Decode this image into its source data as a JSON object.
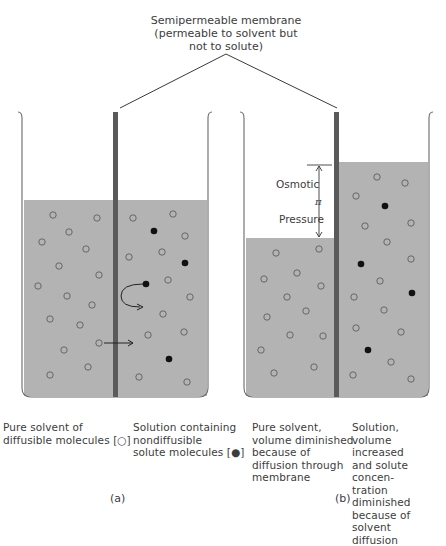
{
  "title": {
    "text": "Semipermeable membrane\n(permeable to solvent but\nnot to solute)"
  },
  "panels": [
    {
      "id": "a",
      "label": "(a)",
      "left_caption": "Pure solvent of\ndiffusible molecules [○]",
      "right_caption": "Solution containing\nnondiffusible\nsolute molecules [●]"
    },
    {
      "id": "b",
      "label": "(b)",
      "left_caption": "Pure solvent,\nvolume diminished\nbecause of\ndiffusion through\nmembrane",
      "right_caption": "Solution,\nvolume increased\nand solute concen-\ntration diminished\nbecause of solvent\ndiffusion",
      "annotation_top": "Osmotic",
      "annotation_symbol": "π",
      "annotation_bottom": "Pressure"
    }
  ],
  "colors": {
    "liquid": "#b3b3b3",
    "membrane": "#5a5a5a",
    "beaker_outline": "#6a6a6a",
    "molecule_outline": "#5e5e5e",
    "solute": "#111111",
    "text": "#3c3c3c"
  },
  "legend": {
    "solvent_symbol": "○",
    "solute_symbol": "●"
  }
}
